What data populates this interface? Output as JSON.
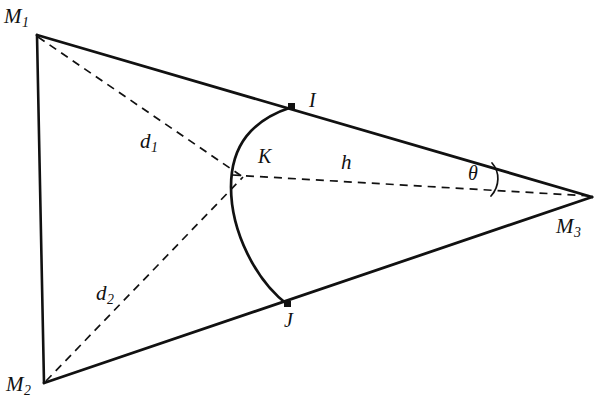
{
  "figure": {
    "background_color": "#ffffff",
    "stroke_color": "#111111",
    "solid_line_width": 2.6,
    "dashed_line_width": 1.6,
    "arc_line_width": 2.6,
    "dash_pattern": "8 6"
  },
  "labels": {
    "m1": {
      "base": "M",
      "sub": "1"
    },
    "m2": {
      "base": "M",
      "sub": "2"
    },
    "m3": {
      "base": "M",
      "sub": "3"
    },
    "d1": {
      "base": "d",
      "sub": "1"
    },
    "d2": {
      "base": "d",
      "sub": "2"
    },
    "h": {
      "base": "h"
    },
    "i": {
      "base": "I"
    },
    "j": {
      "base": "J"
    },
    "k": {
      "base": "K"
    },
    "theta": {
      "base": "θ"
    }
  },
  "geometry": {
    "points": {
      "M1": {
        "x": 37,
        "y": 35
      },
      "M2": {
        "x": 44,
        "y": 383
      },
      "M3": {
        "x": 592,
        "y": 197
      },
      "I": {
        "x": 292,
        "y": 107
      },
      "J": {
        "x": 288,
        "y": 305
      },
      "K": {
        "x": 242,
        "y": 176
      }
    },
    "solid_edges": [
      {
        "name": "edge-M1-M2",
        "from": "M1",
        "to": "M2"
      },
      {
        "name": "edge-M1-M3",
        "from": "M1",
        "to": "M3"
      },
      {
        "name": "edge-M2-M3",
        "from": "M2",
        "to": "M3"
      }
    ],
    "dashed_lines": [
      {
        "name": "dashed-d1-M1-M3",
        "label": "d1"
      },
      {
        "name": "dashed-d2-M2-M3",
        "label": "d2"
      },
      {
        "name": "dashed-h-K-M3",
        "label": "h"
      }
    ],
    "arc": {
      "name": "arc-I-K-J",
      "through": [
        "I",
        "K",
        "J"
      ],
      "bulge_direction": "left"
    },
    "angle_marker": {
      "name": "theta-angle-arc",
      "vertex": "M3",
      "between": [
        "edge-M1-M3",
        "dashed-h-K-M3"
      ]
    }
  }
}
